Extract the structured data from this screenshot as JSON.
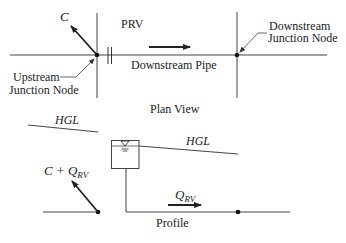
{
  "plan_view": {
    "title": "Plan View",
    "labels": {
      "c": "C",
      "prv": "PRV",
      "downstream_pipe": "Downstream Pipe",
      "upstream_node_line1": "Upstream",
      "upstream_node_line2": "Junction Node",
      "downstream_node_line1": "Downstream",
      "downstream_node_line2": "Junction Node"
    }
  },
  "profile_view": {
    "title": "Profile",
    "labels": {
      "hgl_left": "HGL",
      "hgl_right": "HGL",
      "c_plus_q": "C + Q",
      "c_plus_q_sub": "RV",
      "q": "Q",
      "q_sub": "RV"
    }
  },
  "colors": {
    "line": "#333333",
    "text": "#222222",
    "background": "#ffffff"
  }
}
